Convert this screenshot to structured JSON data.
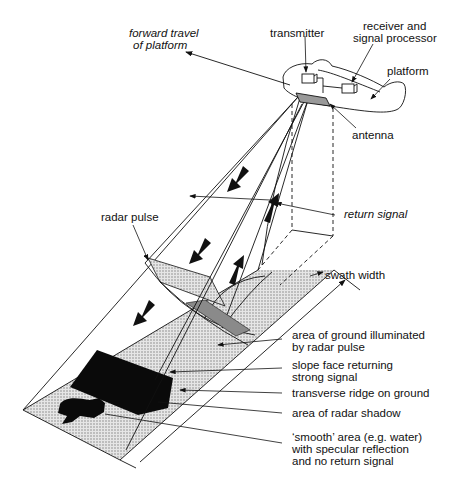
{
  "figure": {
    "type": "sidelooking-radar-schematic",
    "labels": {
      "forward_travel": [
        "forward travel",
        "of platform"
      ],
      "transmitter": "transmitter",
      "receiver": [
        "receiver and",
        "signal processor"
      ],
      "platform": "platform",
      "antenna": "antenna",
      "radar_pulse": "radar pulse",
      "return_signal": "return signal",
      "swath_width": "swath width",
      "illuminated": [
        "area of ground illuminated",
        "by radar pulse"
      ],
      "slope_face": [
        "slope face returning",
        "strong signal"
      ],
      "ridge": "transverse ridge on ground",
      "shadow": "area of radar shadow",
      "smooth": [
        "‘smooth’ area (e.g. water)",
        "with specular reflection",
        "and no return signal"
      ]
    },
    "colors": {
      "line": "#111111",
      "ground_fill": "#d6d6d6",
      "pulse_fill": "#c4c4c4",
      "slope_fill": "#8a8a8a",
      "shadow_fill": "#0a0a0a",
      "background": "#ffffff"
    }
  }
}
